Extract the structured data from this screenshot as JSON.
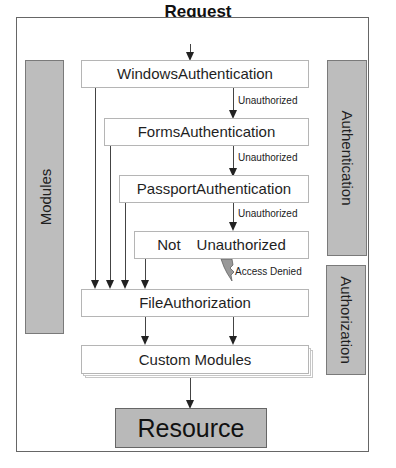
{
  "diagram": {
    "title": "Request",
    "side_panels": {
      "left": "Modules",
      "right_top": "Authentication",
      "right_bottom": "Authorization"
    },
    "nodes": {
      "windows": "WindowsAuthentication",
      "forms": "FormsAuthentication",
      "passport": "PassportAuthentication",
      "not_unauth_left": "Not",
      "not_unauth_right": "Unauthorized",
      "file_auth": "FileAuthorization",
      "custom": "Custom Modules",
      "resource": "Resource"
    },
    "edge_labels": {
      "unauth1": "Unauthorized",
      "unauth2": "Unauthorized",
      "unauth3": "Unauthorized",
      "denied": "Access Denied"
    },
    "colors": {
      "panel_fill": "#bdbdbd",
      "box_border": "#b5b5b5",
      "arrow": "#222222"
    }
  }
}
